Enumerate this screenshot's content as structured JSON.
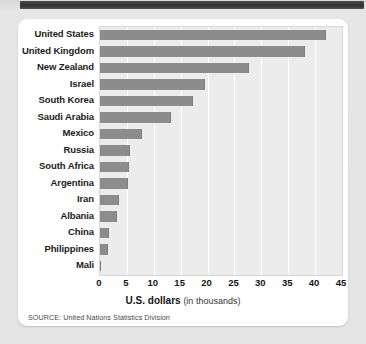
{
  "source_note": "SOURCE: United Nations Statistics Division",
  "axis_title": {
    "strong": "U.S. dollars",
    "sub": "(in thousands)"
  },
  "colors": {
    "bar": "#8c8c8c",
    "plot_background": "#ececec",
    "gridline": "#ffffff",
    "card": "#ffffff",
    "page_background": "#e4e4e4",
    "text": "#141414"
  },
  "chart_data": {
    "type": "bar",
    "orientation": "horizontal",
    "title": "",
    "xlabel": "U.S. dollars (in thousands)",
    "ylabel": "",
    "xlim": [
      0,
      45
    ],
    "xticks": [
      0,
      5,
      10,
      15,
      20,
      25,
      30,
      35,
      40,
      45
    ],
    "grid": true,
    "legend": "none",
    "categories": [
      "United States",
      "United Kingdom",
      "New Zealand",
      "Israel",
      "South Korea",
      "Saudi Arabia",
      "Mexico",
      "Russia",
      "South Africa",
      "Argentina",
      "Iran",
      "Albania",
      "China",
      "Philippines",
      "Mali"
    ],
    "values": [
      42.0,
      38.2,
      27.7,
      19.5,
      17.3,
      13.2,
      7.8,
      5.6,
      5.4,
      5.2,
      3.5,
      3.2,
      1.7,
      1.5,
      0.2
    ]
  }
}
